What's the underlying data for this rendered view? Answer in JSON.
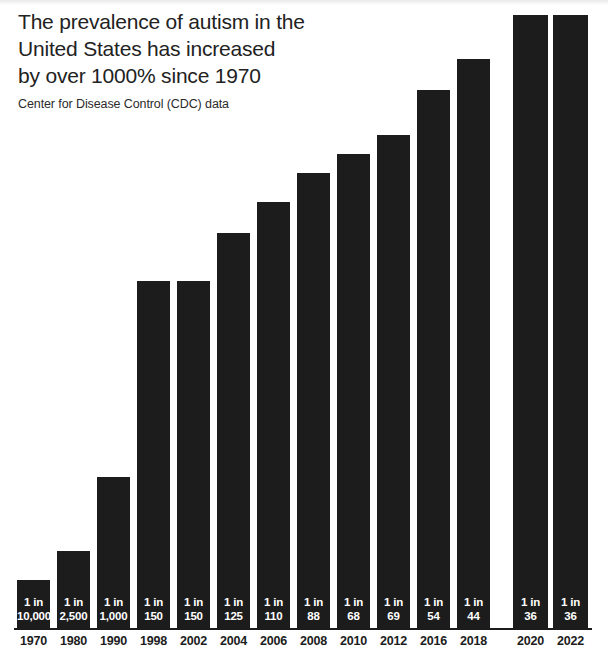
{
  "header": {
    "title": "The prevalence of autism in the United States has increased by over 1000% since 1970",
    "title_line1": "The prevalence of autism in the",
    "title_line2": "United States has increased",
    "title_line3": "by over 1000% since 1970",
    "subtitle": "Center for Disease Control (CDC) data"
  },
  "colors": {
    "bar": "#1c1c1c",
    "background": "#ffffff",
    "text": "#222222",
    "bar_label_text": "#ffffff"
  },
  "chart_data": {
    "type": "bar",
    "title": "The prevalence of autism in the United States has increased by over 1000% since 1970",
    "subtitle": "Center for Disease Control (CDC) data",
    "xlabel": "",
    "ylabel": "",
    "grid": false,
    "legend": "none",
    "value_note": "Bar height encodes prevalence rate (1 in N); taller bar = higher prevalence = smaller N",
    "categories": [
      "1970",
      "1980",
      "1990",
      "1998",
      "2002",
      "2004",
      "2006",
      "2008",
      "2010",
      "2012",
      "2016",
      "2018",
      "2020",
      "2022"
    ],
    "denominators": [
      10000,
      2500,
      1000,
      150,
      150,
      125,
      110,
      88,
      68,
      69,
      54,
      44,
      36,
      36
    ],
    "value_labels_line1": [
      "1 in",
      "1 in",
      "1 in",
      "1 in",
      "1 in",
      "1 in",
      "1 in",
      "1 in",
      "1 in",
      "1 in",
      "1 in",
      "1 in",
      "1 in",
      "1 in"
    ],
    "value_labels_line2": [
      "10,000",
      "2,500",
      "1,000",
      "150",
      "150",
      "125",
      "110",
      "88",
      "68",
      "69",
      "54",
      "44",
      "36",
      "36"
    ],
    "bar_pixel_heights": [
      49,
      78,
      152,
      348,
      348,
      396,
      427,
      456,
      475,
      494,
      539,
      570,
      614,
      614
    ],
    "points": [
      {
        "year": "1970",
        "label_line1": "1 in",
        "label_line2": "10,000",
        "denominator": 10000,
        "bar_top_y": 580,
        "bar_left_x": 17,
        "bar_width": 33
      },
      {
        "year": "1980",
        "label_line1": "1 in",
        "label_line2": "2,500",
        "denominator": 2500,
        "bar_top_y": 551,
        "bar_left_x": 57,
        "bar_width": 33
      },
      {
        "year": "1990",
        "label_line1": "1 in",
        "label_line2": "1,000",
        "denominator": 1000,
        "bar_top_y": 477,
        "bar_left_x": 97,
        "bar_width": 33
      },
      {
        "year": "1998",
        "label_line1": "1 in",
        "label_line2": "150",
        "denominator": 150,
        "bar_top_y": 281,
        "bar_left_x": 137,
        "bar_width": 33
      },
      {
        "year": "2002",
        "label_line1": "1 in",
        "label_line2": "150",
        "denominator": 150,
        "bar_top_y": 281,
        "bar_left_x": 177,
        "bar_width": 33
      },
      {
        "year": "2004",
        "label_line1": "1 in",
        "label_line2": "125",
        "denominator": 125,
        "bar_top_y": 233,
        "bar_left_x": 217,
        "bar_width": 33
      },
      {
        "year": "2006",
        "label_line1": "1 in",
        "label_line2": "110",
        "denominator": 110,
        "bar_top_y": 202,
        "bar_left_x": 257,
        "bar_width": 33
      },
      {
        "year": "2008",
        "label_line1": "1 in",
        "label_line2": "88",
        "denominator": 88,
        "bar_top_y": 173,
        "bar_left_x": 297,
        "bar_width": 33
      },
      {
        "year": "2010",
        "label_line1": "1 in",
        "label_line2": "68",
        "denominator": 68,
        "bar_top_y": 154,
        "bar_left_x": 337,
        "bar_width": 33
      },
      {
        "year": "2012",
        "label_line1": "1 in",
        "label_line2": "69",
        "denominator": 69,
        "bar_top_y": 135,
        "bar_left_x": 377,
        "bar_width": 33
      },
      {
        "year": "2016",
        "label_line1": "1 in",
        "label_line2": "54",
        "denominator": 54,
        "bar_top_y": 90,
        "bar_left_x": 417,
        "bar_width": 33
      },
      {
        "year": "2018",
        "label_line1": "1 in",
        "label_line2": "44",
        "denominator": 44,
        "bar_top_y": 59,
        "bar_left_x": 457,
        "bar_width": 33
      },
      {
        "year": "2020",
        "label_line1": "1 in",
        "label_line2": "36",
        "denominator": 36,
        "bar_top_y": 15,
        "bar_left_x": 513,
        "bar_width": 35
      },
      {
        "year": "2022",
        "label_line1": "1 in",
        "label_line2": "36",
        "denominator": 36,
        "bar_top_y": 15,
        "bar_left_x": 553,
        "bar_width": 35
      }
    ],
    "baseline_y": 629
  }
}
